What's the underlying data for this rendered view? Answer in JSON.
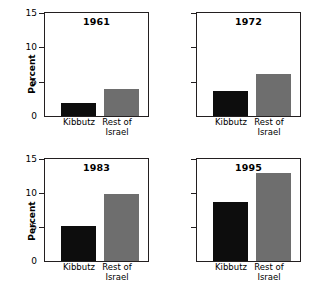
{
  "chart_data": {
    "type": "bar",
    "title": "",
    "xlabel": "",
    "ylabel": "Percent",
    "ylim": [
      0,
      15
    ],
    "yticks": [
      0,
      5,
      10,
      15
    ],
    "grid": false,
    "legend": "none",
    "categories": [
      "Kibbutz",
      "Rest of Israel"
    ],
    "series": [
      {
        "name": "Kibbutz",
        "color": "#0d0d0d"
      },
      {
        "name": "Rest of Israel",
        "color": "#6e6e6e"
      }
    ],
    "panels": [
      {
        "title": "1961",
        "values": [
          1.9,
          3.9
        ],
        "show_y_labels": true
      },
      {
        "title": "1972",
        "values": [
          3.7,
          6.1
        ],
        "show_y_labels": false
      },
      {
        "title": "1983",
        "values": [
          5.1,
          9.8
        ],
        "show_y_labels": true
      },
      {
        "title": "1995",
        "values": [
          8.7,
          13.0
        ],
        "show_y_labels": false
      }
    ]
  },
  "axis": {
    "ylabel": "Percent",
    "tick_15": "15",
    "tick_10": "10",
    "tick_5": "5",
    "tick_0": "0"
  },
  "panels": {
    "p0": {
      "title": "1961",
      "cat0": "Kibbutz",
      "cat1": "Rest of\nIsrael"
    },
    "p1": {
      "title": "1972",
      "cat0": "Kibbutz",
      "cat1": "Rest of\nIsrael"
    },
    "p2": {
      "title": "1983",
      "cat0": "Kibbutz",
      "cat1": "Rest of\nIsrael"
    },
    "p3": {
      "title": "1995",
      "cat0": "Kibbutz",
      "cat1": "Rest of\nIsrael"
    }
  },
  "labels": {
    "kibbutz": "Kibbutz",
    "rest_line1": "Rest of",
    "rest_line2": "Israel"
  }
}
